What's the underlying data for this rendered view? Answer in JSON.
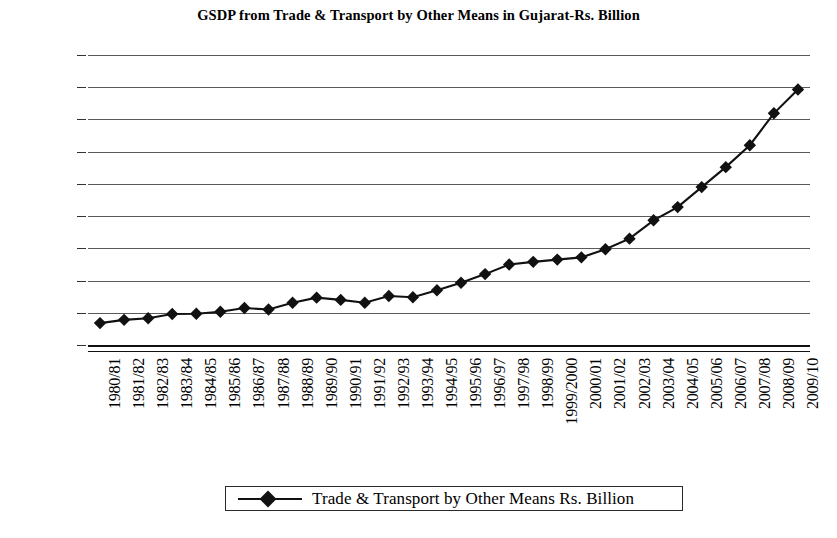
{
  "chart_data": {
    "type": "line",
    "title": "GSDP from Trade & Transport by Other Means in Gujarat-Rs. Billion",
    "xlabel": "",
    "ylabel": "",
    "ylim": [
      0,
      900
    ],
    "ytick_step": 100,
    "ytick_labels": [
      "900.00",
      "800.00",
      "700.00",
      "600.00",
      "500.00",
      "400.00",
      "300.00",
      "200.00",
      "100.00",
      "0.00"
    ],
    "grid": true,
    "legend_position": "bottom",
    "marker": "diamond",
    "line_color": "#111111",
    "marker_color": "#111111",
    "grid_color": "#5a5a5a",
    "categories": [
      "1980/81",
      "1981/82",
      "1982/83",
      "1983/84",
      "1984/85",
      "1985/86",
      "1986/87",
      "1987/88",
      "1988/89",
      "1989/90",
      "1990/91",
      "1991/92",
      "1992/93",
      "1993/94",
      "1994/95",
      "1995/96",
      "1996/97",
      "1997/98",
      "1998/99",
      "1999/2000",
      "2000/01",
      "2001/02",
      "2002/03",
      "2003/04",
      "2004/05",
      "2005/06",
      "2006/07",
      "2007/08",
      "2008/09",
      "2009/10"
    ],
    "series": [
      {
        "name": "Trade & Transport by Other Means Rs. Billion",
        "values": [
          68,
          78,
          83,
          96,
          97,
          103,
          115,
          110,
          131,
          147,
          140,
          131,
          152,
          148,
          170,
          193,
          220,
          250,
          258,
          265,
          272,
          297,
          330,
          387,
          428,
          490,
          552,
          620,
          719,
          793
        ]
      }
    ]
  },
  "legend": {
    "entry_label": "Trade & Transport by Other Means Rs. Billion"
  }
}
